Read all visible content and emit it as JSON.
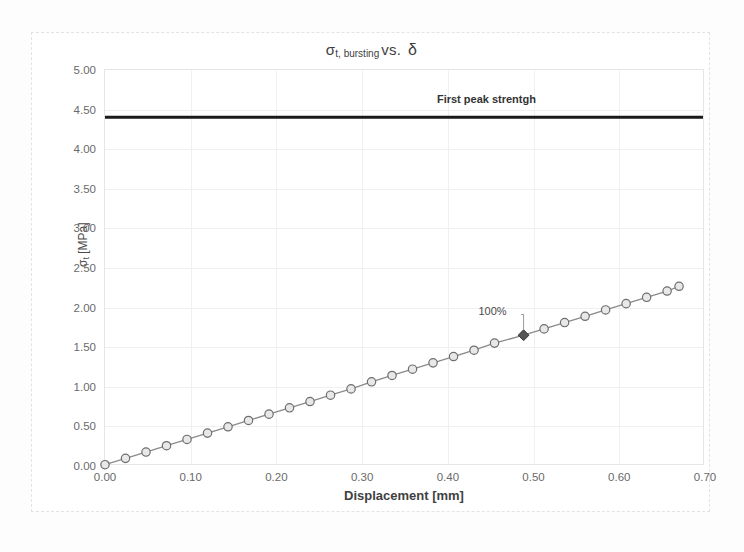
{
  "chart_data": {
    "type": "line",
    "title_parts": {
      "sigma": "σ",
      "subscript": "t, bursting",
      "vs": "vs.",
      "delta": "δ"
    },
    "xlabel": "Displacement [mm]",
    "ylabel": "σt [MPa]",
    "ylabel_parts": {
      "sigma": "σ",
      "subscript": "t",
      "unit": "[MPa]"
    },
    "xlim": [
      0.0,
      0.7
    ],
    "ylim": [
      0.0,
      5.0
    ],
    "xticks": [
      "0.00",
      "0.10",
      "0.20",
      "0.30",
      "0.40",
      "0.50",
      "0.60",
      "0.70"
    ],
    "yticks": [
      "0.00",
      "0.50",
      "1.00",
      "1.50",
      "2.00",
      "2.50",
      "3.00",
      "3.50",
      "4.00",
      "4.50",
      "5.00"
    ],
    "grid": true,
    "legend": "none",
    "series": [
      {
        "name": "First peak strentgh",
        "type": "line",
        "style": "horizontal-reference",
        "color": "#1a1a1a",
        "width": 3,
        "value": 4.4,
        "x": [
          0.0,
          0.7
        ],
        "values": [
          4.4,
          4.4
        ],
        "annotation": {
          "text": "First peak strentgh",
          "x": 0.445,
          "y": 4.62
        }
      },
      {
        "name": "σt, bursting",
        "type": "line",
        "color": "#8a8a8a",
        "marker": "circle",
        "marker_fill": "#e8e8e8",
        "marker_edge": "#6e6e6e",
        "x": [
          0.0,
          0.024,
          0.048,
          0.072,
          0.096,
          0.12,
          0.144,
          0.168,
          0.192,
          0.216,
          0.24,
          0.264,
          0.288,
          0.312,
          0.336,
          0.36,
          0.384,
          0.408,
          0.432,
          0.456,
          0.49,
          0.514,
          0.538,
          0.562,
          0.586,
          0.61,
          0.634,
          0.658,
          0.672
        ],
        "values": [
          0.0,
          0.08,
          0.16,
          0.24,
          0.32,
          0.4,
          0.48,
          0.56,
          0.64,
          0.72,
          0.8,
          0.88,
          0.96,
          1.05,
          1.13,
          1.21,
          1.29,
          1.37,
          1.45,
          1.54,
          1.64,
          1.72,
          1.8,
          1.88,
          1.96,
          2.04,
          2.12,
          2.2,
          2.26
        ],
        "highlight_point": {
          "label": "100%",
          "x": 0.49,
          "y": 1.64,
          "marker": "diamond",
          "color": "#555555",
          "label_x": 0.452,
          "label_y": 1.94
        }
      }
    ]
  }
}
